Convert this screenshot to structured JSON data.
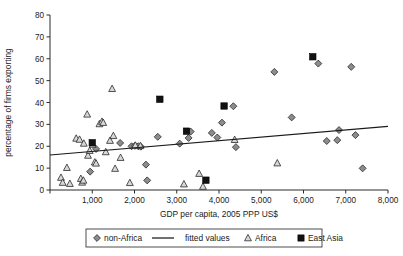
{
  "chart_data": {
    "type": "scatter",
    "title": "",
    "xlabel": "GDP per capita, 2005 PPP US$",
    "ylabel": "percentage of firms exporting",
    "xlim": [
      0,
      8000
    ],
    "ylim": [
      0,
      80
    ],
    "grid": false,
    "legend_position": "bottom",
    "xticks": [
      0,
      1000,
      2000,
      3000,
      4000,
      5000,
      6000,
      7000,
      8000
    ],
    "xtick_labels": [
      "",
      "1,000",
      "2,000",
      "3,000",
      "4,000",
      "5,000",
      "6,000",
      "7,000",
      "8,000"
    ],
    "yticks": [
      0,
      10,
      20,
      30,
      40,
      50,
      60,
      70,
      80
    ],
    "ytick_labels": [
      "0",
      "10",
      "20",
      "30",
      "40",
      "50",
      "60",
      "70",
      "80"
    ],
    "series": [
      {
        "name": "non-Africa",
        "marker": "diamond",
        "color": "#8c8c8c",
        "points": [
          [
            950,
            8.4
          ],
          [
            1090,
            18.8
          ],
          [
            1660,
            21.5
          ],
          [
            1930,
            20.0
          ],
          [
            2010,
            20.2
          ],
          [
            2090,
            20.0
          ],
          [
            2150,
            19.8
          ],
          [
            2270,
            11.6
          ],
          [
            2300,
            4.4
          ],
          [
            2550,
            24.3
          ],
          [
            3070,
            21.2
          ],
          [
            3280,
            23.8
          ],
          [
            3330,
            26.7
          ],
          [
            3830,
            26.1
          ],
          [
            3960,
            24.0
          ],
          [
            4070,
            30.8
          ],
          [
            4340,
            38.3
          ],
          [
            4400,
            19.6
          ],
          [
            5310,
            54.0
          ],
          [
            5720,
            33.2
          ],
          [
            6350,
            57.8
          ],
          [
            6550,
            22.4
          ],
          [
            6800,
            22.8
          ],
          [
            6840,
            27.4
          ],
          [
            7130,
            56.3
          ],
          [
            7230,
            25.1
          ],
          [
            7400,
            9.9
          ]
        ]
      },
      {
        "name": "Africa",
        "marker": "triangle",
        "color": "#d8d8d8",
        "points": [
          [
            260,
            5.7
          ],
          [
            300,
            3.4
          ],
          [
            400,
            10.2
          ],
          [
            470,
            2.9
          ],
          [
            620,
            23.6
          ],
          [
            700,
            23.1
          ],
          [
            730,
            5.2
          ],
          [
            760,
            3.5
          ],
          [
            790,
            4.4
          ],
          [
            800,
            21.3
          ],
          [
            880,
            34.6
          ],
          [
            900,
            15.8
          ],
          [
            940,
            18.0
          ],
          [
            1010,
            20.8
          ],
          [
            1060,
            12.7
          ],
          [
            1090,
            12.2
          ],
          [
            1170,
            30.2
          ],
          [
            1230,
            31.3
          ],
          [
            1260,
            30.8
          ],
          [
            1320,
            17.4
          ],
          [
            1420,
            22.6
          ],
          [
            1470,
            46.3
          ],
          [
            1500,
            24.8
          ],
          [
            1540,
            9.8
          ],
          [
            1670,
            14.8
          ],
          [
            1890,
            3.3
          ],
          [
            2020,
            20.4
          ],
          [
            2140,
            20.2
          ],
          [
            3170,
            2.7
          ],
          [
            3530,
            7.5
          ],
          [
            3620,
            1.6
          ],
          [
            4370,
            23.0
          ],
          [
            5380,
            12.3
          ]
        ]
      },
      {
        "name": "East Asia",
        "marker": "square",
        "color": "#111111",
        "points": [
          [
            1000,
            21.6
          ],
          [
            2600,
            41.5
          ],
          [
            3230,
            26.9
          ],
          [
            3690,
            4.5
          ],
          [
            4120,
            38.4
          ],
          [
            6220,
            60.9
          ]
        ]
      },
      {
        "name": "fitted values",
        "marker": "line",
        "color": "#1a1a1a",
        "line": [
          [
            0,
            16.0
          ],
          [
            8000,
            29.1
          ]
        ]
      }
    ]
  },
  "legend": {
    "items": [
      {
        "label": "non-Africa",
        "marker": "diamond-marker-icon"
      },
      {
        "label": "fitted values",
        "marker": "line-marker-icon"
      },
      {
        "label": "Africa",
        "marker": "triangle-marker-icon"
      },
      {
        "label": "East Asia",
        "marker": "square-marker-icon"
      }
    ]
  }
}
